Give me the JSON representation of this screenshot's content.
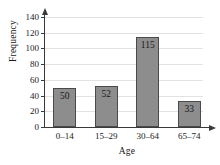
{
  "chart_data": {
    "type": "bar",
    "title": "",
    "xlabel": "Age",
    "ylabel": "Frequency",
    "categories": [
      "0–14",
      "15–29",
      "30–64",
      "65–74"
    ],
    "values": [
      50,
      52,
      115,
      33
    ],
    "value_labels": [
      "50",
      "52",
      "115",
      "33"
    ],
    "ylim": [
      0,
      140
    ],
    "yticks": [
      0,
      20,
      40,
      60,
      80,
      100,
      120,
      140
    ],
    "ytick_labels": [
      "0",
      "20",
      "40",
      "60",
      "80",
      "100",
      "120",
      "140"
    ],
    "grid": true,
    "legend": null,
    "bar_color": "#8d8d8d",
    "bar_border_color": "#4a4a4a",
    "axis_color": "#3a3a3a",
    "gridline_color": "#e2e2e2",
    "background_color": "#ffffff"
  }
}
